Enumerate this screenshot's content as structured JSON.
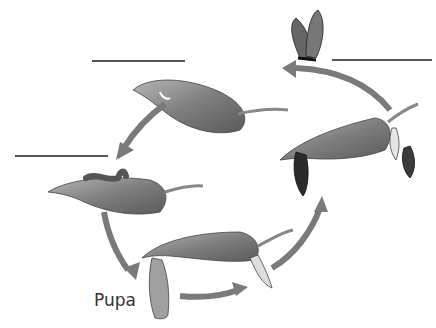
{
  "diagram": {
    "stages": [
      {
        "id": "egg",
        "label": "",
        "blank": true
      },
      {
        "id": "larva",
        "label": "",
        "blank": true
      },
      {
        "id": "pupa",
        "label": "Pupa",
        "blank": false
      },
      {
        "id": "adult",
        "label": "",
        "blank": true
      }
    ],
    "colors": {
      "arrow": "#7a7a7a",
      "leaf": "#8c8c8c",
      "leaf_dark": "#555555",
      "line": "#555555"
    }
  }
}
